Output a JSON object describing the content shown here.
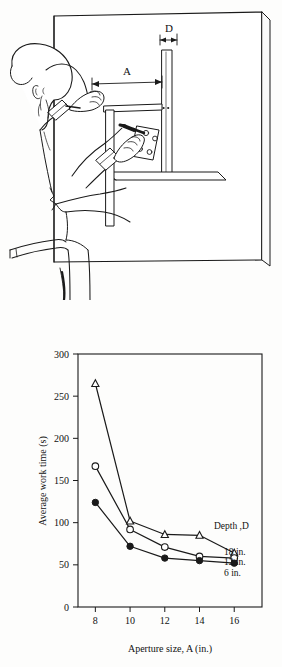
{
  "figure": {
    "illustration": {
      "name": "worker-reaching-through-aperture-illustration",
      "description": "Line drawing of a worker reaching through a rectangular aperture in a vertical panel to fasten a plate with a screwdriver",
      "dimension_labels": [
        {
          "id": "A",
          "label": "A",
          "meaning": "Aperture size"
        },
        {
          "id": "D",
          "label": "D",
          "meaning": "Depth"
        }
      ]
    }
  },
  "chart_data": {
    "type": "line",
    "title": "",
    "xlabel": "Aperture size, A (in.)",
    "ylabel": "Average work time (s)",
    "xlim": [
      7,
      17.6
    ],
    "ylim": [
      0,
      300
    ],
    "xticks": [
      8,
      10,
      12,
      14,
      16
    ],
    "xtick_labels": [
      "8",
      "10",
      "12",
      "14",
      "16"
    ],
    "yticks": [
      0,
      50,
      100,
      150,
      200,
      250,
      300
    ],
    "ytick_labels": [
      "0",
      "50",
      "100",
      "150",
      "200",
      "250",
      "300"
    ],
    "grid": false,
    "legend_position": "inside-right",
    "legend_title": "Depth ,D",
    "x": [
      8,
      10,
      12,
      14,
      16
    ],
    "series": [
      {
        "name": "18 in.",
        "marker": "open-triangle",
        "values": [
          265,
          102,
          86,
          85,
          64
        ]
      },
      {
        "name": "12 in.",
        "marker": "open-circle",
        "values": [
          167,
          92,
          71,
          60,
          58
        ]
      },
      {
        "name": "6 in.",
        "marker": "filled-circle",
        "values": [
          124,
          72,
          58,
          55,
          52
        ]
      }
    ]
  },
  "colors": {
    "ink": "#111111",
    "background": "#fdfdfc",
    "marker_fill_open": "#ffffff"
  }
}
